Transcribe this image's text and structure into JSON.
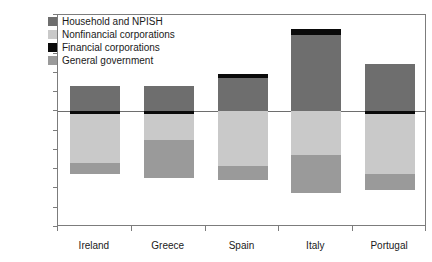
{
  "chart_data": {
    "type": "bar",
    "subtype": "stacked-bar-positive-negative",
    "title": "",
    "xlabel": "",
    "ylabel": "",
    "categories": [
      "Ireland",
      "Greece",
      "Spain",
      "Italy",
      "Portugal"
    ],
    "ylim": [
      -300,
      250
    ],
    "yticks": [
      250,
      200,
      150,
      100,
      50,
      0,
      -50,
      -100,
      -150,
      -200,
      -250,
      -300
    ],
    "ytick_labels": [
      "250",
      "200",
      "150",
      "100",
      "50",
      "0",
      "-50",
      "-100",
      "-150",
      "-200",
      "-250",
      "-300"
    ],
    "grid": false,
    "zero_line": true,
    "legend_position": "top-left",
    "series": [
      {
        "name": "Household and NPISH",
        "color": "#6e6e6e",
        "values": [
          65,
          65,
          87,
          197,
          122
        ]
      },
      {
        "name": "Nonfinancial corporations",
        "color": "#c9c9c9",
        "values": [
          -128,
          -67,
          -143,
          -112,
          -155
        ]
      },
      {
        "name": "Financial corporations",
        "color": "#0a0a0a",
        "values": [
          -7,
          -8,
          9,
          17,
          -7
        ]
      },
      {
        "name": "General government",
        "color": "#9a9a9a",
        "values": [
          -28,
          -97,
          -35,
          -100,
          -43
        ]
      }
    ],
    "stack_totals_negative": [
      -163,
      -172,
      -178,
      -212,
      -205
    ],
    "stack_totals_positive": [
      65,
      65,
      87,
      197,
      122
    ]
  },
  "legend": {
    "items": [
      {
        "label": "Household and NPISH",
        "color": "#6e6e6e",
        "swatch": "legend-swatch-household"
      },
      {
        "label": "Nonfinancial corporations",
        "color": "#c9c9c9",
        "swatch": "legend-swatch-nonfinancial"
      },
      {
        "label": "Financial corporations",
        "color": "#0a0a0a",
        "swatch": "legend-swatch-financial"
      },
      {
        "label": "General government",
        "color": "#9a9a9a",
        "swatch": "legend-swatch-government"
      }
    ]
  },
  "axes": {
    "y_tick_labels": [
      "250",
      "200",
      "150",
      "100",
      "50",
      "0",
      "-50",
      "-100",
      "-150",
      "-200",
      "-250",
      "-300"
    ],
    "x_tick_labels": [
      "Ireland",
      "Greece",
      "Spain",
      "Italy",
      "Portugal"
    ]
  },
  "colors": {
    "household": "#6e6e6e",
    "nonfinancial": "#c9c9c9",
    "financial": "#0a0a0a",
    "government": "#9a9a9a",
    "frame": "#7c7c7c",
    "zero_line": "#6e6e6e",
    "background": "#ffffff",
    "text": "#1a1a1a"
  }
}
